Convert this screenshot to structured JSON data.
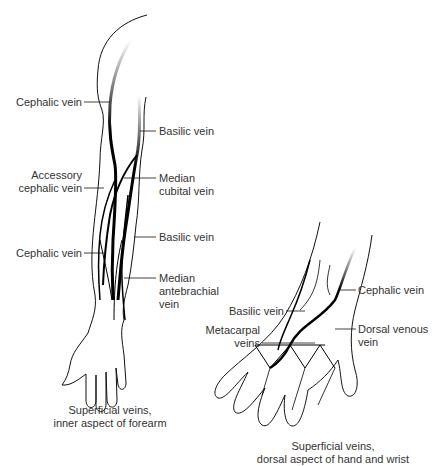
{
  "figure": {
    "left_panel": {
      "caption": [
        "Superficial veins,",
        "inner aspect of forearm"
      ],
      "labels": {
        "cephalic_upper": "Cephalic vein",
        "basilic_upper": "Basilic vein",
        "accessory_cephalic": [
          "Accessory",
          "cephalic vein"
        ],
        "median_cubital": [
          "Median",
          "cubital vein"
        ],
        "basilic_lower": "Basilic vein",
        "cephalic_lower": "Cephalic vein",
        "median_antebrachial": [
          "Median",
          "antebrachial",
          "vein"
        ]
      }
    },
    "right_panel": {
      "caption": [
        "Superficial veins,",
        "dorsal aspect of hand and wrist"
      ],
      "labels": {
        "basilic": "Basilic vein",
        "cephalic": "Cephalic vein",
        "metacarpal": [
          "Metacarpal",
          "veins"
        ],
        "dorsal_venous": [
          "Dorsal venous",
          "vein"
        ]
      }
    }
  }
}
